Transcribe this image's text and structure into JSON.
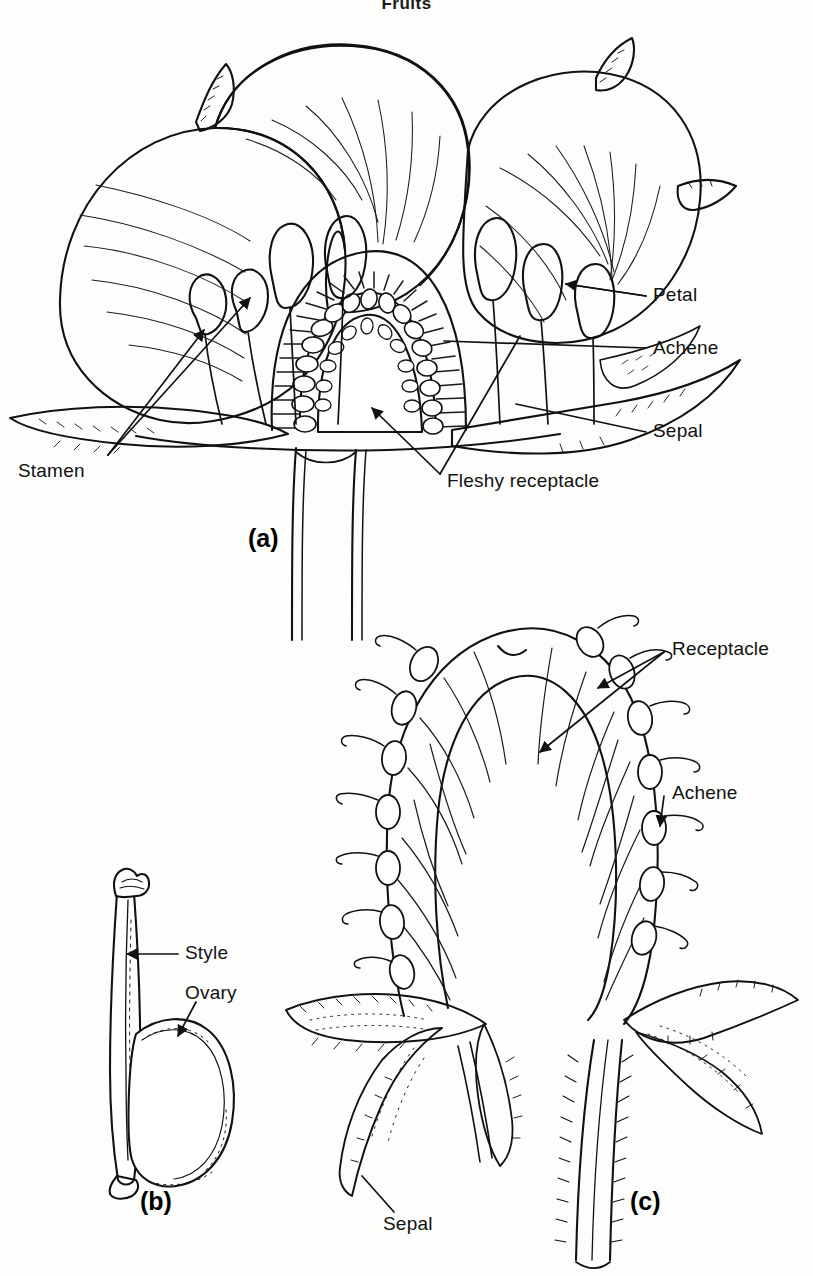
{
  "header": {
    "title": "Fruits"
  },
  "figure": {
    "caption_id": "strawberry-flower-and-fruit",
    "style": "black-and-white-line-drawing"
  },
  "panels": [
    {
      "id": "a",
      "id_label": "(a)",
      "name": "strawberry-flower-longitudinal-section",
      "labels": [
        {
          "key": "stamen",
          "text": "Stamen",
          "x": 18,
          "y": 471
        },
        {
          "key": "petal",
          "text": "Petal",
          "x": 653,
          "y": 295
        },
        {
          "key": "achene",
          "text": "Achene",
          "x": 653,
          "y": 348
        },
        {
          "key": "sepal",
          "text": "Sepal",
          "x": 653,
          "y": 431
        },
        {
          "key": "fleshy-receptacle",
          "text": "Fleshy receptacle",
          "x": 447,
          "y": 481
        }
      ]
    },
    {
      "id": "b",
      "id_label": "(b)",
      "name": "pistil-style-and-ovary",
      "labels": [
        {
          "key": "style",
          "text": "Style",
          "x": 185,
          "y": 953
        },
        {
          "key": "ovary",
          "text": "Ovary",
          "x": 185,
          "y": 993
        }
      ]
    },
    {
      "id": "c",
      "id_label": "(c)",
      "name": "strawberry-fruit-longitudinal-section",
      "labels": [
        {
          "key": "receptacle",
          "text": "Receptacle",
          "x": 672,
          "y": 649
        },
        {
          "key": "achene",
          "text": "Achene",
          "x": 672,
          "y": 793
        },
        {
          "key": "sepal",
          "text": "Sepal",
          "x": 383,
          "y": 1224
        }
      ]
    }
  ],
  "panel_ids": {
    "a": {
      "text": "(a)",
      "x": 248,
      "y": 541
    },
    "b": {
      "text": "(b)",
      "x": 140,
      "y": 1204
    },
    "c": {
      "text": "(c)",
      "x": 630,
      "y": 1204
    }
  },
  "colors": {
    "ink": "#111111",
    "paper": "#fdfdfb",
    "hatch": "#1a1a1a"
  }
}
